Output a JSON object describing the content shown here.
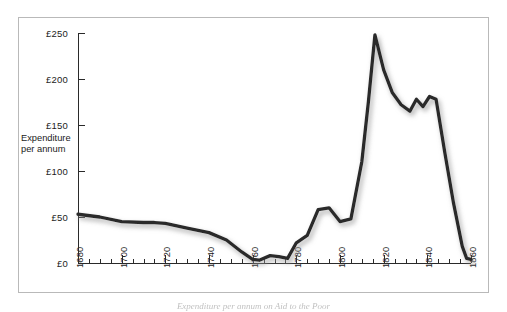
{
  "figure": {
    "background_color": "#ffffff",
    "frame_color": "#b9b9b9",
    "line_color": "#2b2b2b",
    "shadow_color": "#c9c9c9"
  },
  "axis_caption": {
    "line1": "Expenditure",
    "line2": "per annum"
  },
  "bottom_caption": {
    "text": "Expenditure per annum on Aid to the Poor"
  },
  "chart_data": {
    "type": "line",
    "title": "",
    "subtitle": "",
    "xlabel": "",
    "ylabel": "Expenditure per annum",
    "xlim": [
      1680,
      1860
    ],
    "ylim": [
      0,
      250
    ],
    "grid": false,
    "legend": null,
    "x_tick_labels": [
      "1680",
      "1700",
      "1720",
      "1740",
      "1760",
      "1780",
      "1800",
      "1820",
      "1840",
      "1860"
    ],
    "x_tick_values": [
      1680,
      1700,
      1720,
      1740,
      1760,
      1780,
      1800,
      1820,
      1840,
      1860
    ],
    "x_minor_tick_step": 5,
    "y_tick_labels": [
      "£0",
      "£50",
      "£100",
      "£150",
      "£200",
      "£250"
    ],
    "y_tick_values": [
      0,
      50,
      100,
      150,
      200,
      250
    ],
    "currency_symbol": "£",
    "series": [
      {
        "name": "Expenditure per annum",
        "x": [
          1680,
          1690,
          1700,
          1710,
          1715,
          1720,
          1730,
          1740,
          1748,
          1755,
          1760,
          1763,
          1768,
          1772,
          1776,
          1780,
          1785,
          1790,
          1795,
          1800,
          1805,
          1810,
          1813,
          1816,
          1820,
          1824,
          1828,
          1832,
          1835,
          1838,
          1841,
          1844,
          1848,
          1852,
          1856,
          1858,
          1860
        ],
        "y": [
          53,
          50,
          45,
          44,
          44,
          43,
          38,
          33,
          25,
          12,
          4,
          3,
          8,
          7,
          5,
          22,
          30,
          58,
          60,
          45,
          48,
          110,
          175,
          248,
          210,
          185,
          172,
          165,
          178,
          170,
          181,
          178,
          120,
          65,
          18,
          5,
          4
        ]
      }
    ]
  }
}
